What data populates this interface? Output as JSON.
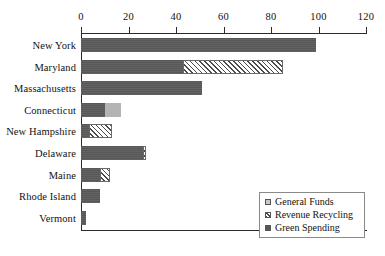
{
  "chart_data": {
    "type": "bar",
    "orientation": "horizontal",
    "stacked": true,
    "title": "",
    "xlabel": "",
    "ylabel": "",
    "xlim": [
      0,
      120
    ],
    "xticks": [
      0,
      20,
      40,
      60,
      80,
      100,
      120
    ],
    "grid": false,
    "legend_position": "bottom-right",
    "categories": [
      "New York",
      "Maryland",
      "Massachusetts",
      "Connecticut",
      "New Hampshire",
      "Delaware",
      "Maine",
      "Rhode Island",
      "Vermont"
    ],
    "series": [
      {
        "name": "General Funds",
        "color": "#b4b4b4",
        "pattern": "solid-light",
        "values": [
          0,
          0,
          0,
          7,
          0,
          0,
          0,
          0,
          0
        ]
      },
      {
        "name": "Revenue Recycling",
        "color": "#ffffff",
        "pattern": "diagonal-hatch",
        "values": [
          0,
          42,
          0,
          0,
          9.5,
          1.5,
          4,
          0,
          0
        ]
      },
      {
        "name": "Green Spending",
        "color": "#575757",
        "pattern": "solid-dark",
        "values": [
          99,
          43,
          51,
          10,
          3.5,
          26,
          8,
          8,
          2
        ]
      }
    ],
    "totals": [
      99,
      85,
      51,
      17,
      13,
      27.5,
      12,
      8,
      2
    ]
  },
  "legend": {
    "items": [
      {
        "label": "General Funds",
        "key": "funds"
      },
      {
        "label": "Revenue Recycling",
        "key": "recycle"
      },
      {
        "label": "Green Spending",
        "key": "green"
      }
    ]
  },
  "colors": {
    "green_spending": "#575757",
    "general_funds": "#b4b4b4",
    "revenue_recycling": "#ffffff",
    "axis": "#2b2b2b",
    "text": "#111111",
    "background": "#ffffff"
  }
}
